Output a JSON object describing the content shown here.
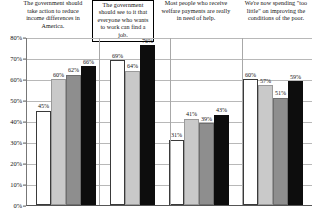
{
  "chart": {
    "type": "bar",
    "title": "",
    "ylabel": "",
    "xlabel": ""
  },
  "axis": {
    "ticks": [
      "80%",
      "70%",
      "60%",
      "50%",
      "40%",
      "30%",
      "20%",
      "10%",
      "0%"
    ],
    "min": 0,
    "max": 80
  },
  "chart_data": {
    "type": "bar",
    "title": "",
    "xlabel": "",
    "ylabel": "",
    "ylim": [
      0,
      80
    ],
    "grid": true,
    "legend": "none",
    "categories": [
      "The government should take action to reduce income differences in America.",
      "The government should see to it that everyone who wants to work can find a job.",
      "Most people who receive welfare payments are really in need of help.",
      "We're now spending \"too little\" on improving the conditions of the poor."
    ],
    "series": [
      {
        "name": "white-bar",
        "style": "white",
        "values": [
          45,
          69,
          31,
          60
        ]
      },
      {
        "name": "light-gray-bar",
        "style": "light",
        "values": [
          60,
          64,
          41,
          57
        ]
      },
      {
        "name": "dark-gray-bar",
        "style": "dark",
        "values": [
          62,
          null,
          39,
          51
        ]
      },
      {
        "name": "black-bar",
        "style": "black",
        "values": [
          66,
          76,
          43,
          59
        ]
      }
    ],
    "value_labels": [
      [
        "45%",
        "60%",
        "62%",
        "66%"
      ],
      [
        "69%",
        "64%",
        "76%"
      ],
      [
        "31%",
        "41%",
        "39%",
        "43%"
      ],
      [
        "60%",
        "57%",
        "51%",
        "59%"
      ]
    ]
  },
  "groups": [
    {
      "caption": "The government should take action to reduce income differences in America.",
      "boxed": false,
      "bars": [
        {
          "style": "white",
          "value": 45,
          "label": "45%"
        },
        {
          "style": "light",
          "value": 60,
          "label": "60%"
        },
        {
          "style": "dark",
          "value": 62,
          "label": "62%"
        },
        {
          "style": "black",
          "value": 66,
          "label": "66%"
        }
      ]
    },
    {
      "caption": "The government should see to it that everyone who wants to work can find a job.",
      "boxed": true,
      "bars": [
        {
          "style": "white",
          "value": 69,
          "label": "69%"
        },
        {
          "style": "light",
          "value": 64,
          "label": "64%"
        },
        {
          "style": "black",
          "value": 76,
          "label": "76%"
        }
      ]
    },
    {
      "caption": "Most people who receive welfare payments are really in need of help.",
      "boxed": false,
      "bars": [
        {
          "style": "white",
          "value": 31,
          "label": "31%"
        },
        {
          "style": "light",
          "value": 41,
          "label": "41%"
        },
        {
          "style": "dark",
          "value": 39,
          "label": "39%"
        },
        {
          "style": "black",
          "value": 43,
          "label": "43%"
        }
      ]
    },
    {
      "caption": "We're now spending \"too little\" on improving the conditions of the poor.",
      "boxed": false,
      "bars": [
        {
          "style": "white",
          "value": 60,
          "label": "60%"
        },
        {
          "style": "light",
          "value": 57,
          "label": "57%"
        },
        {
          "style": "dark",
          "value": 51,
          "label": "51%"
        },
        {
          "style": "black",
          "value": 59,
          "label": "59%"
        }
      ]
    }
  ]
}
